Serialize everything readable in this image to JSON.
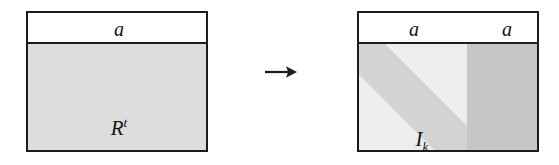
{
  "figure": {
    "caption": "",
    "background_color": "#ffffff",
    "border_color": "#1c1c1c",
    "transform_arrow": "→"
  },
  "left_matrix": {
    "header": {
      "label_a": "a"
    },
    "body": {
      "label_base": "R",
      "label_exponent": "t",
      "fill_color": "#dddddd"
    }
  },
  "arrow": {
    "glyph": "→",
    "name": "transformation-arrow"
  },
  "right_matrix": {
    "header": {
      "label_a_left": "a",
      "label_a_right": "a"
    },
    "identity_block": {
      "label_base": "I",
      "label_subscript": "k",
      "fill_color": "#ededed",
      "diagonal_band_color": "#d3d3d3"
    },
    "rstar_block": {
      "label_base": "R",
      "label_exponent": "*t",
      "fill_color": "#c6c6c6"
    }
  }
}
